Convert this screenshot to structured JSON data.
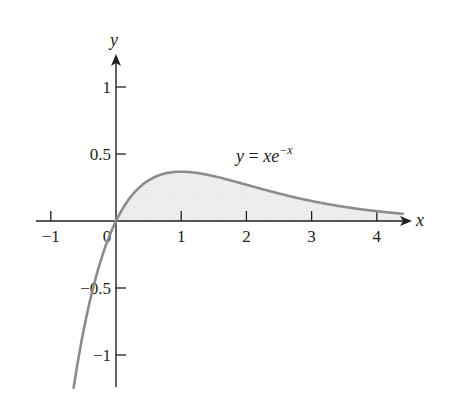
{
  "chart_data": {
    "type": "area",
    "title": "",
    "function": "y = x e^(-x)",
    "xlabel": "x",
    "ylabel": "y",
    "xlim": [
      -1.25,
      4.5
    ],
    "ylim": [
      -1.25,
      1.25
    ],
    "grid": false,
    "x_ticks": [
      -1,
      0,
      1,
      2,
      3,
      4
    ],
    "x_tick_labels": [
      "−1",
      "0",
      "1",
      "2",
      "3",
      "4"
    ],
    "y_ticks": [
      -1,
      -0.5,
      0.5,
      1
    ],
    "y_tick_labels": [
      "−1",
      "−0.5",
      "0.5",
      "1"
    ],
    "curve_domain": [
      -0.65,
      4.4
    ],
    "shaded_region": {
      "from_x": 0,
      "to_x": 4.4,
      "between": "curve and x-axis"
    },
    "annotation": {
      "base": "y = xe",
      "superscript": "−x",
      "at": [
        2.0,
        0.45
      ]
    },
    "sample_points": [
      {
        "x": -0.65,
        "y": -1.25
      },
      {
        "x": -0.5,
        "y": -0.82
      },
      {
        "x": 0,
        "y": 0
      },
      {
        "x": 0.5,
        "y": 0.3
      },
      {
        "x": 1,
        "y": 0.37
      },
      {
        "x": 2,
        "y": 0.27
      },
      {
        "x": 3,
        "y": 0.15
      },
      {
        "x": 4,
        "y": 0.07
      },
      {
        "x": 4.4,
        "y": 0.05
      }
    ],
    "colors": {
      "curve": "#8c8c8c",
      "fill": "#ececec",
      "axes": "#231f20"
    }
  },
  "labels": {
    "x_axis": "x",
    "y_axis": "y",
    "equation_base": "y = xe",
    "equation_sup": "−x"
  }
}
